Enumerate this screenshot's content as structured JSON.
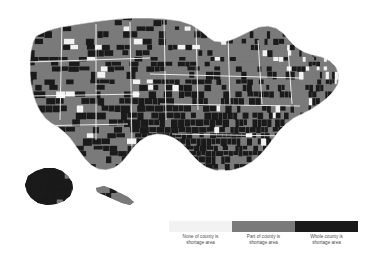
{
  "figure": {
    "background_color": "#ffffff",
    "type": "choropleth-map",
    "region": "United States counties, with Alaska and Hawaii insets"
  },
  "legend": {
    "orientation": "horizontal",
    "position": "bottom-center",
    "text_color": "#4a4a4a",
    "items": [
      {
        "key": "none",
        "label_line1": "None of county is",
        "label_line2": "shortage area",
        "color": "#f2f2f2"
      },
      {
        "key": "part",
        "label_line1": "Part of county is",
        "label_line2": "shortage area",
        "color": "#7a7a7a"
      },
      {
        "key": "whole",
        "label_line1": "Whole county is",
        "label_line2": "shortage area",
        "color": "#1a1a1a"
      }
    ]
  },
  "chart_data": {
    "type": "map",
    "title": "",
    "subtitle": "",
    "xlabel": "",
    "ylabel": "",
    "projection": "albers-usa",
    "grid": false,
    "legend_position": "bottom",
    "categories": [
      "None of county is shortage area",
      "Part of county is shortage area",
      "Whole county is shortage area"
    ],
    "category_colors": [
      "#f2f2f2",
      "#7a7a7a",
      "#1a1a1a"
    ],
    "boundary_color": "#ffffff",
    "regions": [
      {
        "name": "contiguous-united-states",
        "shape": "M 36 36 L 49 30 L 61 27 L 73 25 L 86 23 L 100 21 L 116 19 L 133 18 L 150 18 L 166 19 L 180 21 L 192 25 L 201 31 L 208 37 L 214 41 L 222 42 L 231 40 L 240 36 L 250 31 L 259 27 L 268 26 L 276 28 L 283 33 L 289 40 L 296 47 L 304 52 L 313 55 L 322 57 L 330 61 L 336 67 L 339 75 L 338 84 L 333 92 L 326 99 L 318 105 L 310 110 L 302 114 L 294 118 L 286 124 L 279 131 L 273 139 L 267 147 L 260 155 L 252 162 L 243 167 L 233 170 L 223 171 L 214 170 L 206 167 L 199 162 L 193 156 L 187 149 L 181 143 L 174 138 L 166 135 L 157 134 L 148 136 L 140 141 L 133 148 L 127 156 L 121 163 L 114 168 L 106 170 L 98 169 L 91 165 L 85 159 L 80 152 L 75 145 L 70 138 L 64 132 L 58 127 L 51 123 L 45 118 L 40 111 L 36 103 L 33 94 L 31 84 L 30 73 L 30 62 L 31 51 L 33 42 Z"
      },
      {
        "name": "alaska-inset",
        "shape": "M 28 176 L 36 171 L 45 168 L 54 168 L 62 171 L 68 176 L 72 182 L 73 189 L 70 196 L 64 201 L 56 204 L 47 205 L 38 203 L 31 198 L 27 192 L 25 185 Z"
      },
      {
        "name": "hawaii-inset",
        "shape": "M 96 188 L 104 186 L 112 189 L 120 193 L 128 197 L 134 202 L 130 205 L 122 203 L 113 199 L 104 195 L 97 192 Z"
      }
    ],
    "summary": {
      "dominant_category_west": "Part of county is shortage area",
      "dominant_category_southeast": "Whole county is shortage area",
      "dominant_category_northeast": "Part of county is shortage area",
      "alaska_category": "Whole county is shortage area"
    }
  }
}
